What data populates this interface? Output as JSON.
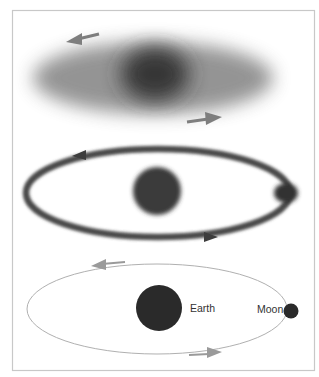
{
  "diagram": {
    "title": "",
    "panels": [
      {
        "name": "diffuse-cloud",
        "description": "Diffuse cloud with dense center, rotating",
        "arrows": [
          {
            "direction": "left"
          },
          {
            "direction": "right"
          }
        ]
      },
      {
        "name": "ring-stage",
        "description": "Ring orbiting central body with clump forming on ring",
        "arrows": [
          {
            "direction": "left"
          },
          {
            "direction": "right"
          }
        ]
      },
      {
        "name": "earth-moon-orbit",
        "description": "Earth with Moon in orbit",
        "labels": {
          "earth": "Earth",
          "moon": "Moon"
        },
        "arrows": [
          {
            "direction": "left"
          },
          {
            "direction": "right"
          }
        ]
      }
    ],
    "colors": {
      "frame": "#c8c8c8",
      "cloud": "#8a8a8a",
      "core": "#3a3a3a",
      "ring": "#4a4a4a",
      "arrow": "#8c8c8c",
      "orbit_line": "#b0b0b0",
      "body": "#2a2a2a"
    }
  }
}
